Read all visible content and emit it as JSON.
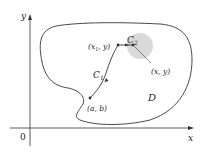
{
  "axes": {
    "x_label": "x",
    "y_label": "y",
    "origin_label": "0"
  },
  "region": {
    "label": "D"
  },
  "paths": {
    "c1_label": "C",
    "c1_sub": "1",
    "c2_label": "C",
    "c2_sub": "2"
  },
  "points": {
    "start": "(a, b)",
    "mid_prefix": "(x",
    "mid_sub": "1",
    "mid_suffix": ", y)",
    "end": "(x, y)"
  },
  "colors": {
    "stroke": "#333333",
    "disk_fill": "#d9d9d9",
    "text": "#222222"
  }
}
